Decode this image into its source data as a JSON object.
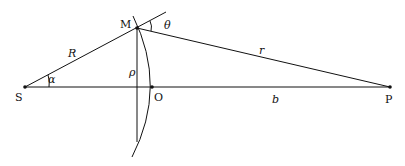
{
  "diagram": {
    "type": "geometry",
    "points": {
      "S": {
        "label": "S",
        "x": 25,
        "y": 87
      },
      "M": {
        "label": "M",
        "x": 137,
        "y": 28
      },
      "O": {
        "label": "O",
        "x": 152,
        "y": 87
      },
      "P": {
        "label": "P",
        "x": 390,
        "y": 87
      }
    },
    "segment_labels": {
      "R": "R",
      "r": "r",
      "rho": "ρ",
      "b": "b"
    },
    "angle_labels": {
      "alpha": "α",
      "theta": "θ"
    },
    "colors": {
      "stroke": "#111111",
      "background": "#ffffff"
    }
  }
}
